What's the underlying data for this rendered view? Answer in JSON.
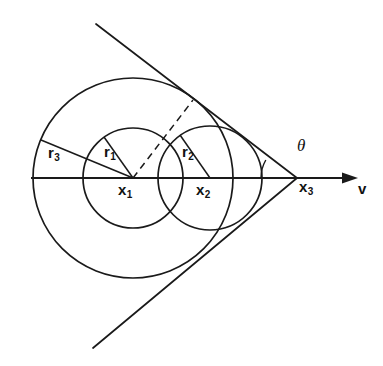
{
  "figure": {
    "type": "geometric-diagram",
    "background_color": "#ffffff",
    "stroke_color": "#1a1a1a",
    "labels": {
      "r1": {
        "base": "r",
        "sub": "1",
        "x": 104,
        "y": 144
      },
      "r2": {
        "base": "r",
        "sub": "2",
        "x": 182,
        "y": 144
      },
      "r3": {
        "base": "r",
        "sub": "3",
        "x": 48,
        "y": 145
      },
      "x1": {
        "base": "x",
        "sub": "1",
        "x": 118,
        "y": 182
      },
      "x2": {
        "base": "x",
        "sub": "2",
        "x": 196,
        "y": 182
      },
      "x3": {
        "base": "x",
        "sub": "3",
        "x": 298,
        "y": 179
      },
      "theta": {
        "glyph": "θ",
        "x": 298,
        "y": 139
      },
      "v": {
        "glyph": "v",
        "x": 359,
        "y": 180
      }
    },
    "geometry": {
      "center1": {
        "x": 133,
        "y": 178,
        "label": "x1"
      },
      "center2": {
        "x": 210,
        "y": 178,
        "label": "x2"
      },
      "apex3": {
        "x": 297,
        "y": 178,
        "label": "x3"
      },
      "radius1": 50,
      "radius2": 52,
      "radius3": 100,
      "axis": {
        "x_start": 31,
        "y": 178,
        "x_end": 358
      },
      "arrow_tip_x": 358,
      "cone_half_angle_deg": 30,
      "cone_upper_end": {
        "x": 96,
        "y": 24
      },
      "cone_lower_end": {
        "x": 93,
        "y": 348
      },
      "dashed_line": {
        "from": {
          "x": 133,
          "y": 178
        },
        "to": {
          "x": 193,
          "y": 100
        }
      },
      "radius_line_r1": {
        "from": {
          "x": 133,
          "y": 178
        },
        "to": {
          "x": 104,
          "y": 137
        }
      },
      "radius_line_r2": {
        "from": {
          "x": 210,
          "y": 178
        },
        "to": {
          "x": 180,
          "y": 135
        }
      },
      "radius_line_r3": {
        "from": {
          "x": 133,
          "y": 178
        },
        "to": {
          "x": 41,
          "y": 140
        }
      },
      "theta_arc": {
        "center": {
          "x": 297,
          "y": 178
        },
        "radius": 36,
        "start_deg": 180,
        "end_deg": 150
      }
    }
  }
}
